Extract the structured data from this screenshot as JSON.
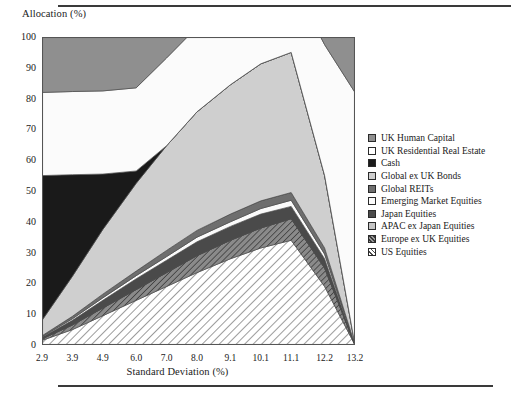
{
  "axes": {
    "ylabel": "Allocation (%)",
    "xlabel": "Standard Deviation (%)",
    "yticks": [
      "100",
      "90",
      "80",
      "70",
      "60",
      "50",
      "40",
      "30",
      "20",
      "10",
      "0"
    ],
    "xticks": [
      "2.9",
      "3.9",
      "4.9",
      "6.0",
      "7.0",
      "8.0",
      "9.1",
      "10.1",
      "11.1",
      "12.2",
      "13.2"
    ]
  },
  "legend": {
    "items": [
      {
        "label": "UK Human Capital",
        "swatch": "solid-medium-gray",
        "color": "#8f8f8f"
      },
      {
        "label": "UK Residential Real Estate",
        "swatch": "solid-white",
        "color": "#ffffff"
      },
      {
        "label": "Cash",
        "swatch": "solid-black",
        "color": "#1a1a1a"
      },
      {
        "label": "Global ex UK Bonds",
        "swatch": "solid-light-gray",
        "color": "#cfcfcf"
      },
      {
        "label": "Global REITs",
        "swatch": "solid-dark-gray",
        "color": "#6e6e6e"
      },
      {
        "label": "Emerging Market Equities",
        "swatch": "solid-white",
        "color": "#fbfbfb"
      },
      {
        "label": "Japan Equities",
        "swatch": "solid-very-dark-gray",
        "color": "#4a4a4a"
      },
      {
        "label": "APAC ex Japan Equities",
        "swatch": "solid-pale-gray",
        "color": "#c4c4c4"
      },
      {
        "label": "Europe ex UK Equities",
        "swatch": "hatched-dark-gray",
        "color": "#787878"
      },
      {
        "label": "US Equities",
        "swatch": "hatched-white",
        "color": "#ffffff"
      }
    ]
  },
  "chart_data": {
    "type": "area",
    "title": "",
    "xlabel": "Standard Deviation (%)",
    "ylabel": "Allocation (%)",
    "xlim": [
      2.9,
      13.2
    ],
    "ylim": [
      0,
      100
    ],
    "grid": false,
    "legend_position": "right",
    "stacked": true,
    "x": [
      2.9,
      3.9,
      4.9,
      6.0,
      7.0,
      8.0,
      9.1,
      10.1,
      11.1,
      12.2,
      13.2
    ],
    "series": [
      {
        "name": "US Equities",
        "fill": "hatched-white",
        "values": [
          1.5,
          5.0,
          9.5,
          14.5,
          19.0,
          23.5,
          28.0,
          31.5,
          34.0,
          19.0,
          0.0
        ]
      },
      {
        "name": "Europe ex UK Equities",
        "fill": "hatched-dark-gray",
        "values": [
          0.5,
          1.5,
          2.5,
          3.5,
          4.5,
          5.5,
          6.0,
          6.5,
          7.0,
          6.0,
          0.0
        ]
      },
      {
        "name": "APAC ex Japan Equities",
        "fill": "solid-pale-gray",
        "values": [
          0.0,
          0.0,
          0.0,
          0.0,
          0.0,
          0.0,
          0.0,
          0.0,
          0.0,
          0.0,
          0.0
        ]
      },
      {
        "name": "Japan Equities",
        "fill": "solid-very-dark-gray",
        "values": [
          0.5,
          1.5,
          2.5,
          3.5,
          4.0,
          4.5,
          4.5,
          4.5,
          4.0,
          3.0,
          0.0
        ]
      },
      {
        "name": "Emerging Market Equities",
        "fill": "solid-white",
        "values": [
          0.2,
          0.5,
          0.8,
          1.0,
          1.2,
          1.5,
          1.5,
          1.8,
          2.0,
          1.5,
          0.0
        ]
      },
      {
        "name": "Global REITs",
        "fill": "solid-dark-gray",
        "values": [
          0.3,
          0.8,
          1.2,
          1.5,
          2.0,
          2.2,
          2.5,
          2.5,
          2.5,
          2.0,
          0.0
        ]
      },
      {
        "name": "Global ex UK Bonds",
        "fill": "solid-light-gray",
        "values": [
          5.0,
          13.0,
          21.0,
          28.5,
          34.0,
          38.5,
          42.0,
          44.5,
          45.5,
          23.5,
          0.0
        ]
      },
      {
        "name": "Cash",
        "fill": "solid-black",
        "values": [
          47.0,
          33.0,
          18.0,
          4.0,
          0.0,
          0.0,
          0.0,
          0.0,
          0.0,
          0.0,
          0.0
        ]
      },
      {
        "name": "UK Residential Real Estate",
        "fill": "solid-white",
        "values": [
          27.0,
          27.0,
          27.0,
          27.0,
          28.5,
          27.5,
          26.5,
          25.0,
          23.5,
          42.5,
          82.0
        ]
      },
      {
        "name": "UK Human Capital",
        "fill": "solid-medium-gray",
        "values": [
          18.0,
          18.0,
          18.0,
          18.0,
          18.0,
          18.0,
          18.0,
          18.0,
          18.0,
          18.0,
          18.0
        ]
      }
    ]
  }
}
